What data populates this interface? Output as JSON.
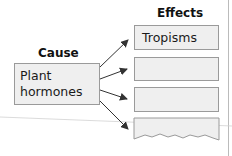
{
  "diagram": {
    "cause": {
      "heading": "Cause",
      "label_line1": "Plant",
      "label_line2": "hormones"
    },
    "effects": {
      "heading": "Effects",
      "items": [
        {
          "label": "Tropisms"
        },
        {
          "label": ""
        },
        {
          "label": ""
        },
        {
          "label": ""
        }
      ]
    },
    "colors": {
      "box_fill": "#efefef",
      "box_border": "#9a9a9a",
      "arrow": "#333333"
    }
  }
}
